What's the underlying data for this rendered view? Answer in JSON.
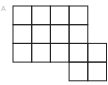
{
  "diagram": {
    "type": "grid-shape",
    "label": "A",
    "line_color": "#222222",
    "cell_size": 18.7,
    "origin": [
      13,
      6
    ],
    "rows": [
      {
        "row": 0,
        "start_col": 0,
        "cells": 4
      },
      {
        "row": 1,
        "start_col": 0,
        "cells": 4
      },
      {
        "row": 2,
        "start_col": 0,
        "cells": 5
      },
      {
        "row": 3,
        "start_col": 3,
        "cells": 2
      }
    ],
    "total_cells": 15
  }
}
